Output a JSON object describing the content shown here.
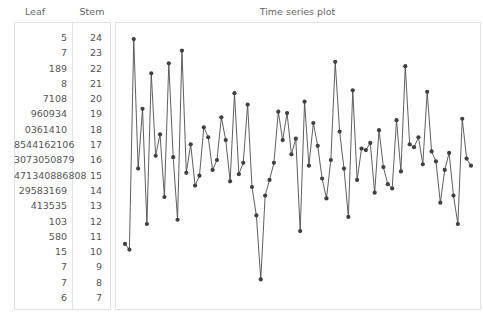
{
  "headers": {
    "leaf": "Leaf",
    "stem": "Stem",
    "plot_title": "Time series plot"
  },
  "stem_leaf": {
    "rows": [
      {
        "leaf": "5",
        "stem": "24"
      },
      {
        "leaf": "7",
        "stem": "23"
      },
      {
        "leaf": "189",
        "stem": "22"
      },
      {
        "leaf": "8",
        "stem": "21"
      },
      {
        "leaf": "7108",
        "stem": "20"
      },
      {
        "leaf": "960934",
        "stem": "19"
      },
      {
        "leaf": "0361410",
        "stem": "18"
      },
      {
        "leaf": "8544162106",
        "stem": "17"
      },
      {
        "leaf": "3073050879",
        "stem": "16"
      },
      {
        "leaf": "471340886808",
        "stem": "15"
      },
      {
        "leaf": "29583169",
        "stem": "14"
      },
      {
        "leaf": "413535",
        "stem": "13"
      },
      {
        "leaf": "103",
        "stem": "12"
      },
      {
        "leaf": "580",
        "stem": "11"
      },
      {
        "leaf": "15",
        "stem": "10"
      },
      {
        "leaf": "7",
        "stem": "9"
      },
      {
        "leaf": "7",
        "stem": "8"
      },
      {
        "leaf": "6",
        "stem": "7"
      }
    ]
  },
  "colors": {
    "line": "#4d4d4d",
    "marker": "#404040",
    "panel_border": "#e3e3e3",
    "text": "#555555"
  },
  "chart_data": {
    "type": "line",
    "title": "Time series plot",
    "xlabel": "",
    "ylabel": "",
    "grid": false,
    "legend": null,
    "marker": "filled-circle",
    "xlim": [
      1,
      80
    ],
    "ylim": [
      7.0,
      25.0
    ],
    "x": [
      1,
      2,
      3,
      4,
      5,
      6,
      7,
      8,
      9,
      10,
      11,
      12,
      13,
      14,
      15,
      16,
      17,
      18,
      19,
      20,
      21,
      22,
      23,
      24,
      25,
      26,
      27,
      28,
      29,
      30,
      31,
      32,
      33,
      34,
      35,
      36,
      37,
      38,
      39,
      40,
      41,
      42,
      43,
      44,
      45,
      46,
      47,
      48,
      49,
      50,
      51,
      52,
      53,
      54,
      55,
      56,
      57,
      58,
      59,
      60,
      61,
      62,
      63,
      64,
      65,
      66,
      67,
      68,
      69,
      70,
      71,
      72,
      73,
      74,
      75,
      76,
      77,
      78,
      79,
      80
    ],
    "values": [
      10.1,
      9.7,
      24.5,
      15.4,
      19.6,
      11.5,
      22.1,
      16.3,
      17.8,
      13.4,
      22.8,
      16.2,
      11.8,
      23.7,
      15.1,
      17.1,
      14.2,
      14.9,
      18.3,
      17.6,
      15.3,
      16.0,
      19.0,
      17.4,
      14.5,
      20.7,
      15.0,
      15.8,
      19.9,
      14.1,
      12.1,
      7.6,
      13.5,
      14.6,
      15.8,
      19.4,
      17.4,
      19.3,
      16.4,
      17.5,
      11.0,
      20.1,
      15.6,
      18.6,
      17.0,
      14.7,
      13.3,
      16.0,
      22.9,
      18.0,
      15.4,
      12.0,
      20.9,
      14.6,
      16.8,
      16.7,
      17.2,
      13.7,
      18.1,
      15.5,
      14.3,
      14.0,
      18.8,
      15.2,
      22.6,
      17.1,
      16.9,
      17.6,
      15.7,
      20.8,
      16.6,
      15.9,
      13.0,
      15.3,
      16.5,
      13.5,
      11.5,
      18.9,
      16.1,
      15.6
    ]
  }
}
